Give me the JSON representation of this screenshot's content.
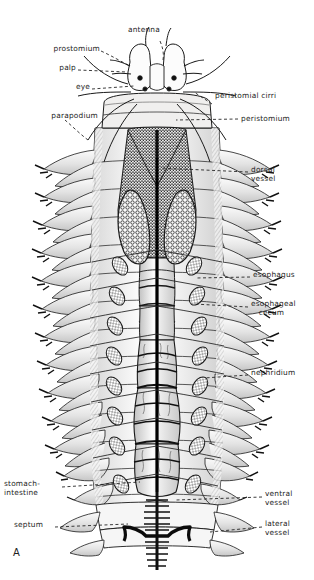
{
  "figure": {
    "letter": "A",
    "organism": "polychaete annelid (Nereis) internal anatomy, dorsal view",
    "background_color": "#ffffff",
    "ink_color": "#1a1a1a"
  },
  "labels": {
    "antenna": "antenna",
    "prostomium": "prostomium",
    "palp": "palp",
    "eye": "eye",
    "parapodium": "parapodium",
    "peristomial_cirri": "peristomial cirri",
    "peristomium": "peristomium",
    "dorsal_vessel": "dorsal\nvessel",
    "esophagus": "esophagus",
    "esophageal_cecum": "esophageal\n   cecum",
    "nephridium": "nephridium",
    "stomach_intestine": "stomach-\nintestine",
    "septum": "septum",
    "ventral_vessel": "ventral\nvessel",
    "lateral_vessel": "lateral\nvessel"
  },
  "anatomy": {
    "body_segments": 13,
    "parapodia_pairs": 13,
    "eyes": 4,
    "antennae": 2,
    "palps": 2,
    "peristomial_cirri": 8,
    "esophageal_ceca": 2,
    "nephridia_pairs": 9
  }
}
